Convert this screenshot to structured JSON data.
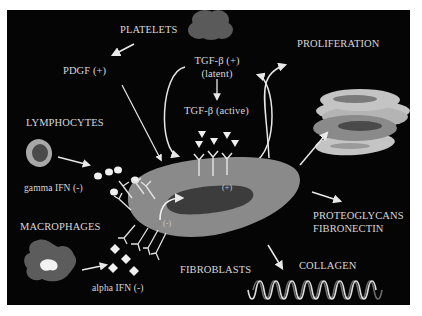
{
  "labels": {
    "platelets": "PLATELETS",
    "pdgf": "PDGF (+)",
    "tgf_latent_line1": "TGF-β (+)",
    "tgf_latent_line2": "(latent)",
    "tgf_active": "TGF-β (active)",
    "proliferation": "PROLIFERATION",
    "lymphocytes": "LYMPHOCYTES",
    "gamma_ifn": "gamma IFN (-)",
    "macrophages": "MACROPHAGES",
    "alpha_ifn": "alpha IFN (-)",
    "fibroblasts": "FIBROBLASTS",
    "collagen": "COLLAGEN",
    "proteoglycans": "PROTEOGLYCANS",
    "fibronectin": "FIBRONECTIN",
    "plus_sign": "(+)",
    "minus_sign": "(-)"
  },
  "colors": {
    "background": "#050505",
    "text": "#d8d8d8",
    "cell_body": "#8a8a8a",
    "nucleus": "#3a3a3a",
    "light_cell": "#c4c4c4",
    "dark_blob": "#5a5a5a",
    "arrow": "#e8e8e8"
  }
}
